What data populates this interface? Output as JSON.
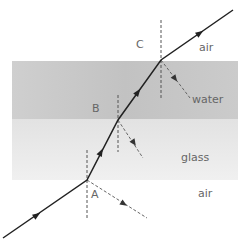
{
  "diagram": {
    "type": "refraction-ray-diagram",
    "media": [
      {
        "name": "water",
        "label": "water",
        "color": "#c4c4c4",
        "y_top": 61,
        "y_bottom": 119
      },
      {
        "name": "glass",
        "label": "glass",
        "color": "#e8e8e8",
        "y_top": 119,
        "y_bottom": 180
      }
    ],
    "labels": {
      "point_a": "A",
      "point_b": "B",
      "point_c": "C",
      "air_top": "air",
      "water": "water",
      "glass": "glass",
      "air_bottom": "air"
    },
    "ray": {
      "color": "#222222",
      "points": [
        [
          3,
          238
        ],
        [
          87,
          180
        ],
        [
          118,
          120
        ],
        [
          161,
          60
        ],
        [
          233,
          10
        ]
      ]
    },
    "normals": [
      {
        "at": "A",
        "x": 87,
        "y1": 150,
        "y2": 218
      },
      {
        "at": "B",
        "x": 118,
        "y1": 95,
        "y2": 152
      },
      {
        "at": "C",
        "x": 161,
        "y1": 20,
        "y2": 98
      }
    ],
    "partial_reflections": [
      {
        "at": "A",
        "from": [
          87,
          180
        ],
        "to": [
          147,
          218
        ]
      },
      {
        "at": "B",
        "from": [
          118,
          120
        ],
        "to": [
          143,
          158
        ]
      },
      {
        "at": "C",
        "from": [
          161,
          60
        ],
        "to": [
          190,
          98
        ]
      }
    ]
  }
}
